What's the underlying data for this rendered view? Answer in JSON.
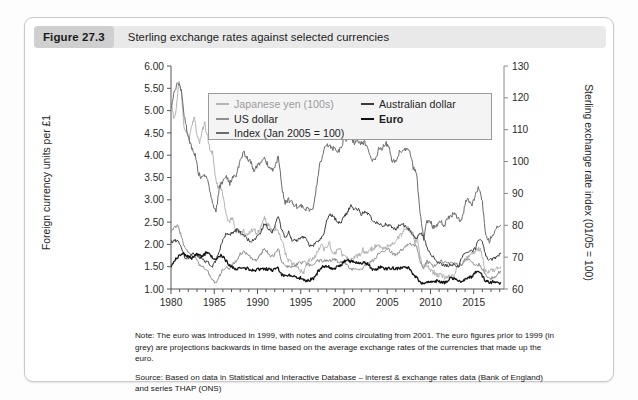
{
  "figure": {
    "number": "Figure 27.3",
    "caption": "Sterling exchange rates against selected currencies"
  },
  "notes": {
    "note": "Note: The euro was introduced in 1999, with notes and coins circulating from 2001. The euro figures prior to 1999 (in grey) are projections backwards in time based on the average exchange rates of the currencies that made up the euro.",
    "source": "Source: Based on data in Statistical and Interactive Database – interest & exchange rates data (Bank of England) and series THAP (ONS)"
  },
  "chart_data": {
    "type": "line",
    "title": "Sterling exchange rates against selected currencies",
    "xlabel": "",
    "ylabel": "Foreign currency units per £1",
    "y2label": "Sterling exchange rate index (01/05 = 100)",
    "xlim": [
      1980,
      2018.5
    ],
    "ylim": [
      1.0,
      6.0
    ],
    "y2lim": [
      60,
      130
    ],
    "grid": false,
    "legend_position": "top-center-inside",
    "xticks": [
      "1980",
      "1985",
      "1990",
      "1995",
      "2000",
      "2005",
      "2010",
      "2015"
    ],
    "xtick_values": [
      1980,
      1985,
      1990,
      1995,
      2000,
      2005,
      2010,
      2015
    ],
    "yticks": [
      "1.00",
      "1.50",
      "2.00",
      "2.50",
      "3.00",
      "3.50",
      "4.00",
      "4.50",
      "5.00",
      "5.50",
      "6.00"
    ],
    "ytick_values": [
      1.0,
      1.5,
      2.0,
      2.5,
      3.0,
      3.5,
      4.0,
      4.5,
      5.0,
      5.5,
      6.0
    ],
    "y2ticks": [
      "60",
      "70",
      "80",
      "90",
      "100",
      "110",
      "120",
      "130"
    ],
    "y2tick_values": [
      60,
      70,
      80,
      90,
      100,
      110,
      120,
      130
    ],
    "series": [
      {
        "name": "Japanese yen (100s)",
        "color": "#b4b4b4",
        "axis": "left",
        "x": [
          1980.0,
          1980.3,
          1980.6,
          1980.9,
          1981.2,
          1981.5,
          1981.8,
          1982.1,
          1982.4,
          1982.7,
          1983.0,
          1983.3,
          1983.6,
          1983.9,
          1984.2,
          1984.5,
          1984.8,
          1985.1,
          1985.4,
          1985.7,
          1986.0,
          1986.3,
          1986.6,
          1986.9,
          1987.2,
          1987.5,
          1987.8,
          1988.1,
          1988.4,
          1988.7,
          1989.0,
          1989.3,
          1989.6,
          1989.9,
          1990.2,
          1990.5,
          1990.8,
          1991.1,
          1991.4,
          1991.7,
          1992.0,
          1992.3,
          1992.6,
          1992.9,
          1993.2,
          1993.5,
          1993.8,
          1994.1,
          1994.4,
          1994.7,
          1995.0,
          1995.3,
          1995.6,
          1995.9,
          1996.2,
          1996.5,
          1996.8,
          1997.1,
          1997.4,
          1997.7,
          1998.0,
          1998.3,
          1998.6,
          1998.9,
          1999.2,
          1999.5,
          1999.8,
          2000.1,
          2000.4,
          2000.7,
          2001.0,
          2001.3,
          2001.6,
          2001.9,
          2002.2,
          2002.5,
          2002.8,
          2003.1,
          2003.4,
          2003.7,
          2004.0,
          2004.3,
          2004.6,
          2004.9,
          2005.2,
          2005.5,
          2005.8,
          2006.1,
          2006.4,
          2006.7,
          2007.0,
          2007.3,
          2007.6,
          2007.9,
          2008.2,
          2008.5,
          2008.8,
          2009.1,
          2009.4,
          2009.7,
          2010.0,
          2010.3,
          2010.6,
          2010.9,
          2011.2,
          2011.5,
          2011.8,
          2012.1,
          2012.4,
          2012.7,
          2013.0,
          2013.3,
          2013.6,
          2013.9,
          2014.2,
          2014.5,
          2014.8,
          2015.1,
          2015.4,
          2015.7,
          2016.0,
          2016.3,
          2016.6,
          2016.9,
          2017.2,
          2017.5,
          2017.8,
          2018.1
        ],
        "y": [
          5.35,
          4.8,
          5.05,
          5.65,
          5.4,
          4.6,
          4.55,
          4.35,
          4.65,
          4.85,
          4.45,
          4.25,
          4.55,
          4.7,
          4.45,
          4.1,
          4.05,
          3.55,
          3.3,
          3.35,
          3.1,
          2.75,
          2.5,
          2.55,
          2.55,
          2.3,
          2.3,
          2.25,
          2.3,
          2.2,
          2.25,
          2.3,
          2.35,
          2.25,
          2.3,
          2.45,
          2.6,
          2.45,
          2.4,
          2.3,
          2.35,
          2.35,
          2.2,
          2.05,
          1.8,
          1.65,
          1.6,
          1.58,
          1.52,
          1.48,
          1.4,
          1.35,
          1.5,
          1.62,
          1.66,
          1.7,
          1.78,
          1.92,
          1.98,
          1.9,
          1.9,
          2.05,
          1.85,
          1.78,
          1.86,
          1.92,
          1.75,
          1.72,
          1.68,
          1.62,
          1.68,
          1.72,
          1.74,
          1.78,
          1.88,
          1.8,
          1.82,
          1.88,
          1.92,
          1.96,
          1.98,
          1.95,
          1.9,
          1.94,
          1.98,
          2.02,
          2.05,
          2.12,
          2.18,
          2.22,
          2.32,
          2.38,
          2.32,
          2.28,
          2.05,
          2.12,
          1.72,
          1.48,
          1.55,
          1.52,
          1.42,
          1.38,
          1.35,
          1.3,
          1.32,
          1.28,
          1.25,
          1.28,
          1.32,
          1.28,
          1.48,
          1.52,
          1.55,
          1.62,
          1.7,
          1.75,
          1.78,
          1.82,
          1.88,
          1.9,
          1.72,
          1.38,
          1.4,
          1.42,
          1.44,
          1.42,
          1.48,
          1.5
        ]
      },
      {
        "name": "US dollar",
        "color": "#8e8e8e",
        "axis": "left",
        "x": [
          1980.0,
          1980.4,
          1980.8,
          1981.2,
          1981.6,
          1982.0,
          1982.4,
          1982.8,
          1983.2,
          1983.6,
          1984.0,
          1984.4,
          1984.8,
          1985.2,
          1985.6,
          1986.0,
          1986.4,
          1986.8,
          1987.2,
          1987.6,
          1988.0,
          1988.4,
          1988.8,
          1989.2,
          1989.6,
          1990.0,
          1990.4,
          1990.8,
          1991.2,
          1991.6,
          1992.0,
          1992.4,
          1992.8,
          1993.2,
          1993.6,
          1994.0,
          1994.4,
          1994.8,
          1995.2,
          1995.6,
          1996.0,
          1996.4,
          1996.8,
          1997.2,
          1997.6,
          1998.0,
          1998.4,
          1998.8,
          1999.2,
          1999.6,
          2000.0,
          2000.4,
          2000.8,
          2001.2,
          2001.6,
          2002.0,
          2002.4,
          2002.8,
          2003.2,
          2003.6,
          2004.0,
          2004.4,
          2004.8,
          2005.2,
          2005.6,
          2006.0,
          2006.4,
          2006.8,
          2007.2,
          2007.6,
          2008.0,
          2008.4,
          2008.8,
          2009.2,
          2009.6,
          2010.0,
          2010.4,
          2010.8,
          2011.2,
          2011.6,
          2012.0,
          2012.4,
          2012.8,
          2013.2,
          2013.6,
          2014.0,
          2014.4,
          2014.8,
          2015.2,
          2015.6,
          2016.0,
          2016.4,
          2016.8,
          2017.2,
          2017.6,
          2018.1
        ],
        "y": [
          2.28,
          2.38,
          2.42,
          2.18,
          1.9,
          1.82,
          1.76,
          1.72,
          1.55,
          1.52,
          1.45,
          1.34,
          1.22,
          1.12,
          1.3,
          1.44,
          1.5,
          1.44,
          1.58,
          1.65,
          1.78,
          1.85,
          1.78,
          1.72,
          1.62,
          1.68,
          1.78,
          1.92,
          1.82,
          1.72,
          1.78,
          1.92,
          1.62,
          1.5,
          1.52,
          1.5,
          1.52,
          1.58,
          1.6,
          1.58,
          1.54,
          1.54,
          1.62,
          1.64,
          1.62,
          1.65,
          1.64,
          1.68,
          1.62,
          1.6,
          1.6,
          1.52,
          1.45,
          1.44,
          1.42,
          1.44,
          1.52,
          1.56,
          1.62,
          1.66,
          1.82,
          1.82,
          1.88,
          1.88,
          1.8,
          1.76,
          1.84,
          1.9,
          1.97,
          2.02,
          1.98,
          1.96,
          1.62,
          1.44,
          1.62,
          1.56,
          1.5,
          1.58,
          1.62,
          1.6,
          1.58,
          1.57,
          1.6,
          1.52,
          1.55,
          1.66,
          1.68,
          1.6,
          1.52,
          1.55,
          1.44,
          1.32,
          1.24,
          1.25,
          1.31,
          1.4
        ]
      },
      {
        "name": "Index (Jan 2005 = 100)",
        "color": "#6b6b6b",
        "axis": "right",
        "x": [
          1980.0,
          1980.4,
          1980.8,
          1981.2,
          1981.6,
          1982.0,
          1982.4,
          1982.8,
          1983.2,
          1983.6,
          1984.0,
          1984.4,
          1984.8,
          1985.2,
          1985.6,
          1986.0,
          1986.4,
          1986.8,
          1987.2,
          1987.6,
          1988.0,
          1988.4,
          1988.8,
          1989.2,
          1989.6,
          1990.0,
          1990.4,
          1990.8,
          1991.2,
          1991.6,
          1992.0,
          1992.4,
          1992.8,
          1993.2,
          1993.6,
          1994.0,
          1994.4,
          1994.8,
          1995.2,
          1995.6,
          1996.0,
          1996.4,
          1996.8,
          1997.2,
          1997.6,
          1998.0,
          1998.4,
          1998.8,
          1999.2,
          1999.6,
          2000.0,
          2000.4,
          2000.8,
          2001.2,
          2001.6,
          2002.0,
          2002.4,
          2002.8,
          2003.2,
          2003.6,
          2004.0,
          2004.4,
          2004.8,
          2005.2,
          2005.6,
          2006.0,
          2006.4,
          2006.8,
          2007.2,
          2007.6,
          2008.0,
          2008.4,
          2008.8,
          2009.2,
          2009.6,
          2010.0,
          2010.4,
          2010.8,
          2011.2,
          2011.6,
          2012.0,
          2012.4,
          2012.8,
          2013.2,
          2013.6,
          2014.0,
          2014.4,
          2014.8,
          2015.2,
          2015.6,
          2016.0,
          2016.4,
          2016.8,
          2017.2,
          2017.6,
          2018.1
        ],
        "y": [
          117,
          122,
          125,
          122,
          113,
          108,
          104,
          102,
          96,
          95,
          96,
          92,
          87,
          84,
          92,
          94,
          95,
          93,
          95,
          96,
          100,
          103,
          101,
          100,
          97,
          99,
          100,
          101,
          99,
          97,
          98,
          102,
          92,
          87,
          88,
          87,
          86,
          86,
          86,
          85,
          85,
          85,
          92,
          99,
          103,
          105,
          105,
          104,
          103,
          104,
          107,
          107,
          107,
          106,
          106,
          106,
          106,
          104,
          101,
          100,
          104,
          104,
          106,
          104,
          100,
          100,
          103,
          104,
          104,
          104,
          98,
          96,
          84,
          76,
          81,
          81,
          79,
          80,
          81,
          80,
          82,
          83,
          84,
          82,
          81,
          87,
          88,
          86,
          90,
          92,
          87,
          77,
          75,
          77,
          79,
          80
        ]
      },
      {
        "name": "Australian dollar",
        "color": "#3a3a3a",
        "axis": "left",
        "x": [
          1980.0,
          1980.4,
          1980.8,
          1981.2,
          1981.6,
          1982.0,
          1982.4,
          1982.8,
          1983.2,
          1983.6,
          1984.0,
          1984.4,
          1984.8,
          1985.2,
          1985.6,
          1986.0,
          1986.4,
          1986.8,
          1987.2,
          1987.6,
          1988.0,
          1988.4,
          1988.8,
          1989.2,
          1989.6,
          1990.0,
          1990.4,
          1990.8,
          1991.2,
          1991.6,
          1992.0,
          1992.4,
          1992.8,
          1993.2,
          1993.6,
          1994.0,
          1994.4,
          1994.8,
          1995.2,
          1995.6,
          1996.0,
          1996.4,
          1996.8,
          1997.2,
          1997.6,
          1998.0,
          1998.4,
          1998.8,
          1999.2,
          1999.6,
          2000.0,
          2000.4,
          2000.8,
          2001.2,
          2001.6,
          2002.0,
          2002.4,
          2002.8,
          2003.2,
          2003.6,
          2004.0,
          2004.4,
          2004.8,
          2005.2,
          2005.6,
          2006.0,
          2006.4,
          2006.8,
          2007.2,
          2007.6,
          2008.0,
          2008.4,
          2008.8,
          2009.2,
          2009.6,
          2010.0,
          2010.4,
          2010.8,
          2011.2,
          2011.6,
          2012.0,
          2012.4,
          2012.8,
          2013.2,
          2013.6,
          2014.0,
          2014.4,
          2014.8,
          2015.2,
          2015.6,
          2016.0,
          2016.4,
          2016.8,
          2017.2,
          2017.6,
          2018.1
        ],
        "y": [
          2.05,
          2.08,
          2.1,
          1.92,
          1.72,
          1.7,
          1.78,
          1.8,
          1.72,
          1.68,
          1.62,
          1.58,
          1.5,
          1.65,
          1.88,
          2.12,
          2.25,
          2.22,
          2.28,
          2.32,
          2.28,
          2.22,
          2.12,
          2.08,
          2.08,
          2.18,
          2.28,
          2.48,
          2.38,
          2.25,
          2.42,
          2.62,
          2.32,
          2.15,
          2.28,
          2.1,
          2.08,
          2.12,
          2.18,
          2.12,
          1.98,
          1.96,
          2.05,
          2.12,
          2.2,
          2.55,
          2.68,
          2.62,
          2.52,
          2.46,
          2.62,
          2.72,
          2.88,
          2.78,
          2.8,
          2.68,
          2.72,
          2.68,
          2.58,
          2.48,
          2.48,
          2.42,
          2.45,
          2.42,
          2.38,
          2.35,
          2.42,
          2.45,
          2.38,
          2.32,
          2.22,
          2.12,
          2.28,
          2.18,
          1.92,
          1.78,
          1.72,
          1.62,
          1.55,
          1.52,
          1.52,
          1.55,
          1.55,
          1.48,
          1.68,
          1.82,
          1.82,
          1.85,
          1.92,
          2.12,
          2.05,
          1.75,
          1.65,
          1.68,
          1.72,
          1.8
        ]
      },
      {
        "name": "Euro",
        "color": "#111111",
        "axis": "left",
        "x": [
          1980.0,
          1980.4,
          1980.8,
          1981.2,
          1981.6,
          1982.0,
          1982.4,
          1982.8,
          1983.2,
          1983.6,
          1984.0,
          1984.4,
          1984.8,
          1985.2,
          1985.6,
          1986.0,
          1986.4,
          1986.8,
          1987.2,
          1987.6,
          1988.0,
          1988.4,
          1988.8,
          1989.2,
          1989.6,
          1990.0,
          1990.4,
          1990.8,
          1991.2,
          1991.6,
          1992.0,
          1992.4,
          1992.8,
          1993.2,
          1993.6,
          1994.0,
          1994.4,
          1994.8,
          1995.2,
          1995.6,
          1996.0,
          1996.4,
          1996.8,
          1997.2,
          1997.6,
          1998.0,
          1998.4,
          1998.8,
          1999.2,
          1999.6,
          2000.0,
          2000.4,
          2000.8,
          2001.2,
          2001.6,
          2002.0,
          2002.4,
          2002.8,
          2003.2,
          2003.6,
          2004.0,
          2004.4,
          2004.8,
          2005.2,
          2005.6,
          2006.0,
          2006.4,
          2006.8,
          2007.2,
          2007.6,
          2008.0,
          2008.4,
          2008.8,
          2009.2,
          2009.6,
          2010.0,
          2010.4,
          2010.8,
          2011.2,
          2011.6,
          2012.0,
          2012.4,
          2012.8,
          2013.2,
          2013.6,
          2014.0,
          2014.4,
          2014.8,
          2015.2,
          2015.6,
          2016.0,
          2016.4,
          2016.8,
          2017.2,
          2017.6,
          2018.1
        ],
        "y": [
          1.5,
          1.62,
          1.72,
          1.8,
          1.78,
          1.72,
          1.7,
          1.78,
          1.76,
          1.72,
          1.8,
          1.78,
          1.7,
          1.68,
          1.76,
          1.72,
          1.62,
          1.52,
          1.48,
          1.45,
          1.46,
          1.48,
          1.46,
          1.44,
          1.42,
          1.44,
          1.45,
          1.46,
          1.44,
          1.42,
          1.44,
          1.46,
          1.32,
          1.28,
          1.3,
          1.3,
          1.28,
          1.26,
          1.22,
          1.18,
          1.2,
          1.22,
          1.32,
          1.45,
          1.52,
          1.5,
          1.48,
          1.45,
          1.5,
          1.52,
          1.62,
          1.64,
          1.62,
          1.62,
          1.6,
          1.58,
          1.58,
          1.56,
          1.45,
          1.42,
          1.48,
          1.48,
          1.46,
          1.46,
          1.46,
          1.46,
          1.46,
          1.48,
          1.48,
          1.46,
          1.32,
          1.26,
          1.15,
          1.1,
          1.14,
          1.14,
          1.18,
          1.18,
          1.15,
          1.14,
          1.2,
          1.24,
          1.24,
          1.18,
          1.18,
          1.22,
          1.25,
          1.27,
          1.38,
          1.4,
          1.28,
          1.18,
          1.15,
          1.16,
          1.13,
          1.14
        ]
      }
    ]
  }
}
